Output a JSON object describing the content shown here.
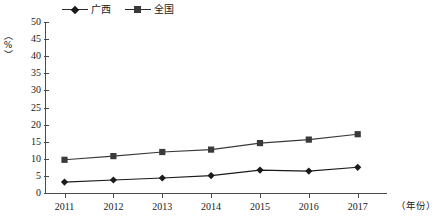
{
  "chart_data": {
    "type": "line",
    "title": "",
    "subtitle": "",
    "xlabel": "（年份）",
    "ylabel": "（%）",
    "categories": [
      "2011",
      "2012",
      "2013",
      "2014",
      "2015",
      "2016",
      "2017"
    ],
    "x": [
      2011,
      2012,
      2013,
      2014,
      2015,
      2016,
      2017
    ],
    "xlim": [
      2010.6,
      2017.6
    ],
    "ylim": [
      0,
      50
    ],
    "ytick_step": 5,
    "yticks": [
      0,
      5,
      10,
      15,
      20,
      25,
      30,
      35,
      40,
      45,
      50
    ],
    "ytick_labels": [
      "0",
      "5",
      "10",
      "15",
      "20",
      "25",
      "30",
      "35",
      "40",
      "45",
      "50"
    ],
    "grid": false,
    "legend_position": "top-left",
    "series": [
      {
        "name": "广西",
        "marker": "diamond",
        "color": "#1a1a1a",
        "values": [
          3.2,
          3.8,
          4.4,
          5.1,
          6.7,
          6.4,
          7.5
        ]
      },
      {
        "name": "全国",
        "marker": "square",
        "color": "#3a3a3a",
        "values": [
          9.7,
          10.8,
          12.0,
          12.7,
          14.6,
          15.6,
          17.2
        ]
      }
    ],
    "annotations": []
  },
  "legend": {
    "entries": [
      {
        "label": "广西",
        "marker": "diamond-marker"
      },
      {
        "label": "全国",
        "marker": "square-marker"
      }
    ]
  },
  "axes": {
    "y_axis_title": "（%）",
    "x_axis_title": "（年份）"
  }
}
